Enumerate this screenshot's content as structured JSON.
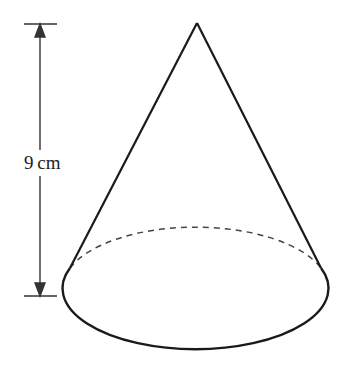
{
  "diagram": {
    "shape": "cone",
    "height_label": "9 cm",
    "dimension": "height",
    "colors": {
      "stroke": "#1a1a1a",
      "dimension": "#333333",
      "background": "#ffffff"
    }
  }
}
